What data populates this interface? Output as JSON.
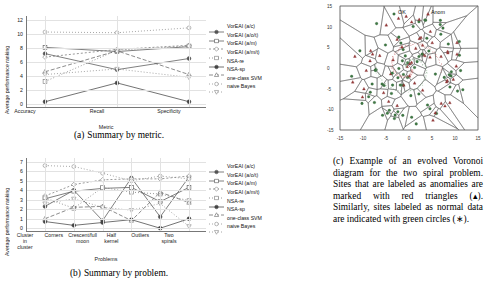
{
  "figure": {
    "legend_entries": [
      {
        "label": "VorEAI (a/c)",
        "dash": "none",
        "marker": "circle-filled",
        "color": "#555555"
      },
      {
        "label": "VorEAI (a/o/t)",
        "dash": "none",
        "marker": "square-open",
        "color": "#555555"
      },
      {
        "label": "VorEAI (a/m)",
        "dash": "2 2",
        "marker": "diamond-open",
        "color": "#777777"
      },
      {
        "label": "VorEAI (a/m/t)",
        "dash": "1 2",
        "marker": "square-open",
        "color": "#777777"
      },
      {
        "label": "NSA-re",
        "dash": "none",
        "marker": "circle-filled",
        "color": "#444444"
      },
      {
        "label": "NSA-sp",
        "dash": "4 2",
        "marker": "triangle-open",
        "color": "#666666"
      },
      {
        "label": "one-class SVM",
        "dash": "1 2",
        "marker": "circle-open",
        "color": "#888888"
      },
      {
        "label": "naive Bayes",
        "dash": "1 2",
        "marker": "triangle-down",
        "color": "#888888"
      }
    ]
  },
  "chart_data": [
    {
      "id": "summary-by-metric",
      "type": "line",
      "title": "",
      "xlabel": "Metric",
      "ylabel": "Average performance ranking",
      "categories": [
        "Accuracy",
        "Recall",
        "Specificity"
      ],
      "ylim": [
        -0.6,
        12.6
      ],
      "yticks": [
        0,
        2,
        4,
        6,
        8,
        10,
        12
      ],
      "grid": true,
      "legend_position": "right",
      "series": [
        {
          "name": "VorEAI (a/c)",
          "values": [
            7.2,
            4.9,
            6.5
          ]
        },
        {
          "name": "VorEAI (a/o/t)",
          "values": [
            8.1,
            7.5,
            8.2
          ]
        },
        {
          "name": "VorEAI (a/m)",
          "values": [
            6.7,
            7.8,
            8.4
          ]
        },
        {
          "name": "VorEAI (a/m/t)",
          "values": [
            3.2,
            7.7,
            8.3
          ]
        },
        {
          "name": "NSA-re",
          "values": [
            0.3,
            3.0,
            0.3
          ]
        },
        {
          "name": "NSA-sp",
          "values": [
            4.6,
            7.6,
            4.2
          ]
        },
        {
          "name": "one-class SVM",
          "values": [
            10.3,
            10.2,
            10.9
          ]
        },
        {
          "name": "naive Bayes",
          "values": [
            4.2,
            5.0,
            3.8
          ]
        }
      ]
    },
    {
      "id": "summary-by-problem",
      "type": "line",
      "title": "",
      "xlabel": "Problems",
      "ylabel": "Average performance ranking",
      "categories": [
        "Cluster in cluster",
        "Corners",
        "Crescent/full moon",
        "Half kernel",
        "Outliers",
        "Two spirals"
      ],
      "category_lines": [
        [
          "Cluster",
          "in",
          "cluster"
        ],
        [
          "Corners"
        ],
        [
          "Crescent/full",
          "moon"
        ],
        [
          "Half",
          "kernel"
        ],
        [
          "Outliers"
        ],
        [
          "Two",
          "spirals"
        ]
      ],
      "ylim": [
        -0.4,
        7.4
      ],
      "yticks": [
        0,
        1,
        2,
        3,
        4,
        5,
        6,
        7
      ],
      "grid": true,
      "legend_position": "right",
      "series": [
        {
          "name": "VorEAI (a/c)",
          "values": [
            2.3,
            4.0,
            0.8,
            5.3,
            1.2,
            5.4
          ]
        },
        {
          "name": "VorEAI (a/o/t)",
          "values": [
            3.1,
            3.9,
            4.2,
            4.3,
            2.8,
            4.3
          ]
        },
        {
          "name": "VorEAI (a/m)",
          "values": [
            3.4,
            4.6,
            5.1,
            5.2,
            5.2,
            5.5
          ]
        },
        {
          "name": "VorEAI (a/m/t)",
          "values": [
            3.2,
            2.1,
            4.3,
            3.8,
            3.6,
            2.9
          ]
        },
        {
          "name": "NSA-re",
          "values": [
            0.7,
            0.3,
            0.6,
            0.9,
            0.0,
            1.0
          ]
        },
        {
          "name": "NSA-sp",
          "values": [
            1.0,
            2.2,
            2.3,
            0.8,
            3.8,
            2.7
          ]
        },
        {
          "name": "one-class SVM",
          "values": [
            6.6,
            6.5,
            5.8,
            5.0,
            5.5,
            5.2
          ]
        },
        {
          "name": "naive Bayes",
          "values": [
            2.6,
            3.1,
            2.2,
            1.9,
            2.6,
            0.2
          ]
        }
      ]
    }
  ],
  "captions": {
    "a_label": "(a)",
    "a_text": "Summary by metric.",
    "b_label": "(b)",
    "b_text": "Summary by problem.",
    "c_text": "(c) Example of an evolved Voronoi diagram for the two spiral problem. Sites that are labeled as anomalies are marked with red triangles (▴). Similarly, sites labeled as normal data are indicated with green circles (∗)."
  },
  "voronoi": {
    "key_ok": "OK",
    "key_anom": "Anom",
    "xticks": [
      "-15",
      "-10",
      "-5",
      "0",
      "5",
      "10",
      "15"
    ],
    "yticks": [
      "15",
      "10",
      "5",
      "0",
      "-5",
      "-10",
      "-15"
    ],
    "marker_ok": "circle",
    "marker_anom": "triangle"
  }
}
